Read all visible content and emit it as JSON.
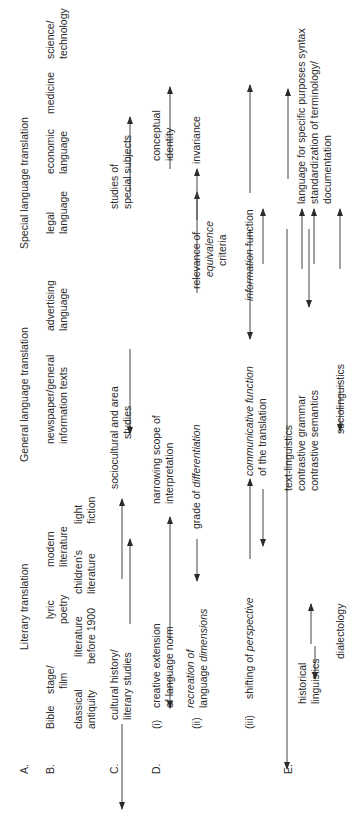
{
  "rows": {
    "A": {
      "label": "A.",
      "headings": [
        "Literary translation",
        "General language translation",
        "Special language translation"
      ]
    },
    "B": {
      "label": "B.",
      "text_types": [
        {
          "line1": "Bible",
          "line2": "classical",
          "line3": "antiquity"
        },
        {
          "line1": "stage/",
          "line2": "film"
        },
        {
          "line1": "literature",
          "line2": "before 1900"
        },
        {
          "line1": "lyric",
          "line2": "poetry"
        },
        {
          "line1": "children's",
          "line2": "literature"
        },
        {
          "line1": "modern",
          "line2": "literature"
        },
        {
          "line1": "light",
          "line2": "fiction"
        },
        {
          "line1": "newspaper/general",
          "line2": "information texts"
        },
        {
          "line1": "advertising",
          "line2": "language"
        },
        {
          "line1": "legal",
          "line2": "language"
        },
        {
          "line1": "economic",
          "line2": "language"
        },
        {
          "line1": "medicine"
        },
        {
          "line1": "science/",
          "line2": "technology"
        }
      ]
    },
    "C": {
      "label": "C.",
      "items": [
        {
          "line1": "cultural history/",
          "line2": "literary studies"
        },
        {
          "line1": "sociocultural and area",
          "line2": "studies"
        },
        {
          "line1": "studies of",
          "line2": "special subjects"
        }
      ]
    },
    "D": {
      "label": "D.",
      "i": {
        "label": "(i)",
        "a1": "creative extension",
        "a2": "of language norm",
        "b1": "narrowing scope of",
        "b2": "interpretation",
        "c1": "conceptual",
        "c2": "identity"
      },
      "ii": {
        "label": "(ii)",
        "a1": "recreation of",
        "a2_plain": "language ",
        "a2_italic": "dimensions",
        "b_plain": "grade of ",
        "b_italic": "differentiation",
        "c1": "relevance of",
        "c2": "equivalence",
        "c3": "criteria",
        "d": "invariance"
      },
      "iii": {
        "label": "(iii)",
        "a_plain": "shifting of ",
        "a_italic": "perspective",
        "b_italic1": "communicative function",
        "b2": "of the translation",
        "c_italic": "information",
        "c_plain": " function"
      }
    },
    "E": {
      "label": "E.",
      "items": {
        "historical1": "historical",
        "historical2": "linguistics",
        "dialectology": "dialectology",
        "text_linguistics": "text-linguistics",
        "contrastive_grammar": "contrastive grammar",
        "contrastive_semantics": "contrastive semantics",
        "sociolinguistics": "sociolinguistics",
        "lsp_syntax": "language for specific purposes syntax",
        "standardization1": "standardization of terminology/",
        "standardization2": "documentation"
      }
    }
  }
}
